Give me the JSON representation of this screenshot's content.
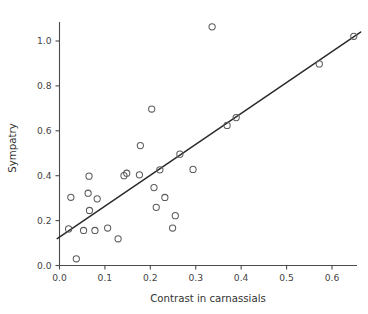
{
  "chart_data": {
    "type": "scatter",
    "title": "",
    "xlabel": "Contrast in carnassials",
    "ylabel": "Sympatry",
    "xlim": [
      -0.02,
      0.675
    ],
    "ylim": [
      -0.02,
      1.1
    ],
    "xticks": [
      0.0,
      0.1,
      0.2,
      0.3,
      0.4,
      0.5,
      0.6
    ],
    "xticklabels": [
      "0.0",
      "0.1",
      "0.2",
      "0.3",
      "0.4",
      "0.5",
      "0.6"
    ],
    "yticks": [
      0.0,
      0.2,
      0.4,
      0.6,
      0.8,
      1.0
    ],
    "yticklabels": [
      "0.0",
      "0.2",
      "0.4",
      "0.6",
      "0.8",
      "1.0"
    ],
    "grid": false,
    "legend": null,
    "marker": {
      "shape": "open-circle",
      "radius_px": 3.1,
      "stroke_color": "#5b5b5b"
    },
    "points": [
      {
        "x": 0.02,
        "y": 0.163
      },
      {
        "x": 0.025,
        "y": 0.304
      },
      {
        "x": 0.037,
        "y": 0.03
      },
      {
        "x": 0.053,
        "y": 0.156
      },
      {
        "x": 0.063,
        "y": 0.322
      },
      {
        "x": 0.065,
        "y": 0.398
      },
      {
        "x": 0.066,
        "y": 0.245
      },
      {
        "x": 0.078,
        "y": 0.156
      },
      {
        "x": 0.083,
        "y": 0.297
      },
      {
        "x": 0.106,
        "y": 0.167
      },
      {
        "x": 0.129,
        "y": 0.119
      },
      {
        "x": 0.142,
        "y": 0.4
      },
      {
        "x": 0.148,
        "y": 0.411
      },
      {
        "x": 0.176,
        "y": 0.404
      },
      {
        "x": 0.178,
        "y": 0.534
      },
      {
        "x": 0.203,
        "y": 0.697
      },
      {
        "x": 0.208,
        "y": 0.347
      },
      {
        "x": 0.213,
        "y": 0.259
      },
      {
        "x": 0.221,
        "y": 0.426
      },
      {
        "x": 0.232,
        "y": 0.303
      },
      {
        "x": 0.249,
        "y": 0.167
      },
      {
        "x": 0.255,
        "y": 0.222
      },
      {
        "x": 0.265,
        "y": 0.496
      },
      {
        "x": 0.294,
        "y": 0.428
      },
      {
        "x": 0.336,
        "y": 1.063
      },
      {
        "x": 0.369,
        "y": 0.624
      },
      {
        "x": 0.389,
        "y": 0.659
      },
      {
        "x": 0.572,
        "y": 0.898
      },
      {
        "x": 0.648,
        "y": 1.021
      }
    ],
    "fit_line": {
      "type": "linear-regression",
      "x_start": -0.005,
      "y_start": 0.12,
      "x_end": 0.663,
      "y_end": 1.04
    },
    "colors": {
      "axis": "#4a4a4a",
      "marker_stroke": "#5b5b5b",
      "fit_line": "#2b2b2b",
      "text": "#333333",
      "background": "#ffffff"
    }
  }
}
